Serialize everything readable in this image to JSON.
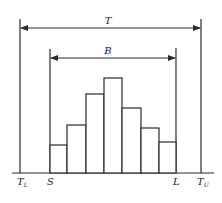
{
  "diagram": {
    "labels": {
      "T": "T",
      "B": "B",
      "TL_main": "T",
      "TL_sub": "L",
      "S": "S",
      "L": "L",
      "TU_main": "T",
      "TU_sub": "U"
    },
    "colors": {
      "stroke": "#2a2a2a",
      "background": "#ffffff"
    },
    "histogram": {
      "bar_count": 7,
      "relative_heights": [
        28,
        48,
        79,
        95,
        65,
        45,
        31
      ]
    }
  }
}
